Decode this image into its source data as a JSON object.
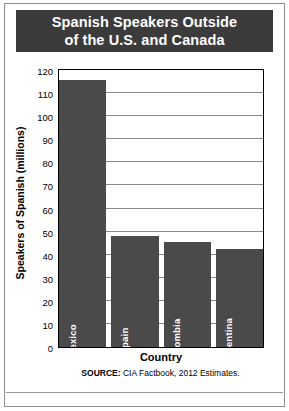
{
  "title": {
    "line1": "Spanish Speakers Outside",
    "line2": "of the U.S. and Canada"
  },
  "source": {
    "prefix": "SOURCE:",
    "text": " CIA Factbook, 2012 Estimates."
  },
  "colors": {
    "title_bar": "#3b3b3b",
    "bar_fill": "#4a4a4a",
    "gridline": "#8a8a8a",
    "axis": "#000000",
    "background": "#ffffff",
    "bar_label_text": "#ffffff"
  },
  "chart_data": {
    "type": "bar",
    "title": "Spanish Speakers Outside of the U.S. and Canada",
    "xlabel": "Country",
    "ylabel": "Speakers of Spanish (millions)",
    "categories": [
      "Mexico",
      "Spain",
      "Colombia",
      "Argentina"
    ],
    "values": [
      115.5,
      48,
      45.5,
      42.5
    ],
    "ylim": [
      0,
      120
    ],
    "yticks": [
      0,
      10,
      20,
      30,
      40,
      50,
      60,
      70,
      80,
      90,
      100,
      110,
      120
    ],
    "ytick_labels": [
      "0",
      "10",
      "20",
      "30",
      "40",
      "50",
      "60",
      "70",
      "80",
      "90",
      "100",
      "110",
      "120"
    ],
    "grid": true,
    "legend": false,
    "bar_labels_inside": true,
    "bar_label_orientation": "vertical",
    "source_note": "SOURCE: CIA Factbook, 2012 Estimates."
  }
}
